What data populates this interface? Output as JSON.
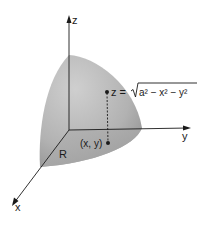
{
  "figure": {
    "axes": {
      "x_label": "x",
      "y_label": "y",
      "z_label": "z"
    },
    "surface_equation": {
      "lhs": "z =",
      "radicand": "a² − x² − y²",
      "full_text": "z = √(a² − x² − y²)"
    },
    "region_label": "R",
    "point_label": "(x, y)",
    "colors": {
      "surface_light": "#c9c9c9",
      "surface_dark": "#8f8f8f",
      "base_region": "#a9a9a9",
      "axes": "#1a1a1a",
      "background": "#ffffff"
    }
  }
}
